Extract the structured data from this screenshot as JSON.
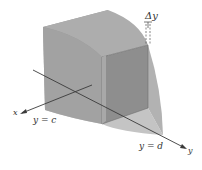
{
  "diagram": {
    "labels": {
      "delta_y": "Δy",
      "x_axis": "x",
      "y_axis": "y",
      "y_eq_c": "y = c",
      "y_eq_d": "y = d"
    },
    "colors": {
      "back_face": "#9a9a9a",
      "top_surface": "#b4b4b4",
      "side_surface": "#a6a6a6",
      "front_face": "#8c8c8c",
      "bottom_surface": "#bdbdbd",
      "axis": "#3a3a3a"
    }
  }
}
